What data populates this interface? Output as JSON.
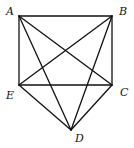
{
  "diagram": {
    "type": "geometry-figure",
    "vertices": [
      {
        "id": "A",
        "label": "A",
        "x": 19,
        "y": 16,
        "lx": 6,
        "ly": 15
      },
      {
        "id": "B",
        "label": "B",
        "x": 112,
        "y": 16,
        "lx": 119,
        "ly": 15
      },
      {
        "id": "C",
        "label": "C",
        "x": 112,
        "y": 85,
        "lx": 120,
        "ly": 96
      },
      {
        "id": "D",
        "label": "D",
        "x": 71,
        "y": 130,
        "lx": 75,
        "ly": 142
      },
      {
        "id": "E",
        "label": "E",
        "x": 19,
        "y": 85,
        "lx": 6,
        "ly": 99
      }
    ],
    "edges": [
      [
        "A",
        "B"
      ],
      [
        "A",
        "E"
      ],
      [
        "B",
        "C"
      ],
      [
        "E",
        "C"
      ],
      [
        "A",
        "C"
      ],
      [
        "B",
        "E"
      ],
      [
        "A",
        "D"
      ],
      [
        "B",
        "D"
      ],
      [
        "E",
        "D"
      ],
      [
        "C",
        "D"
      ]
    ],
    "stroke_color": "#111111"
  }
}
